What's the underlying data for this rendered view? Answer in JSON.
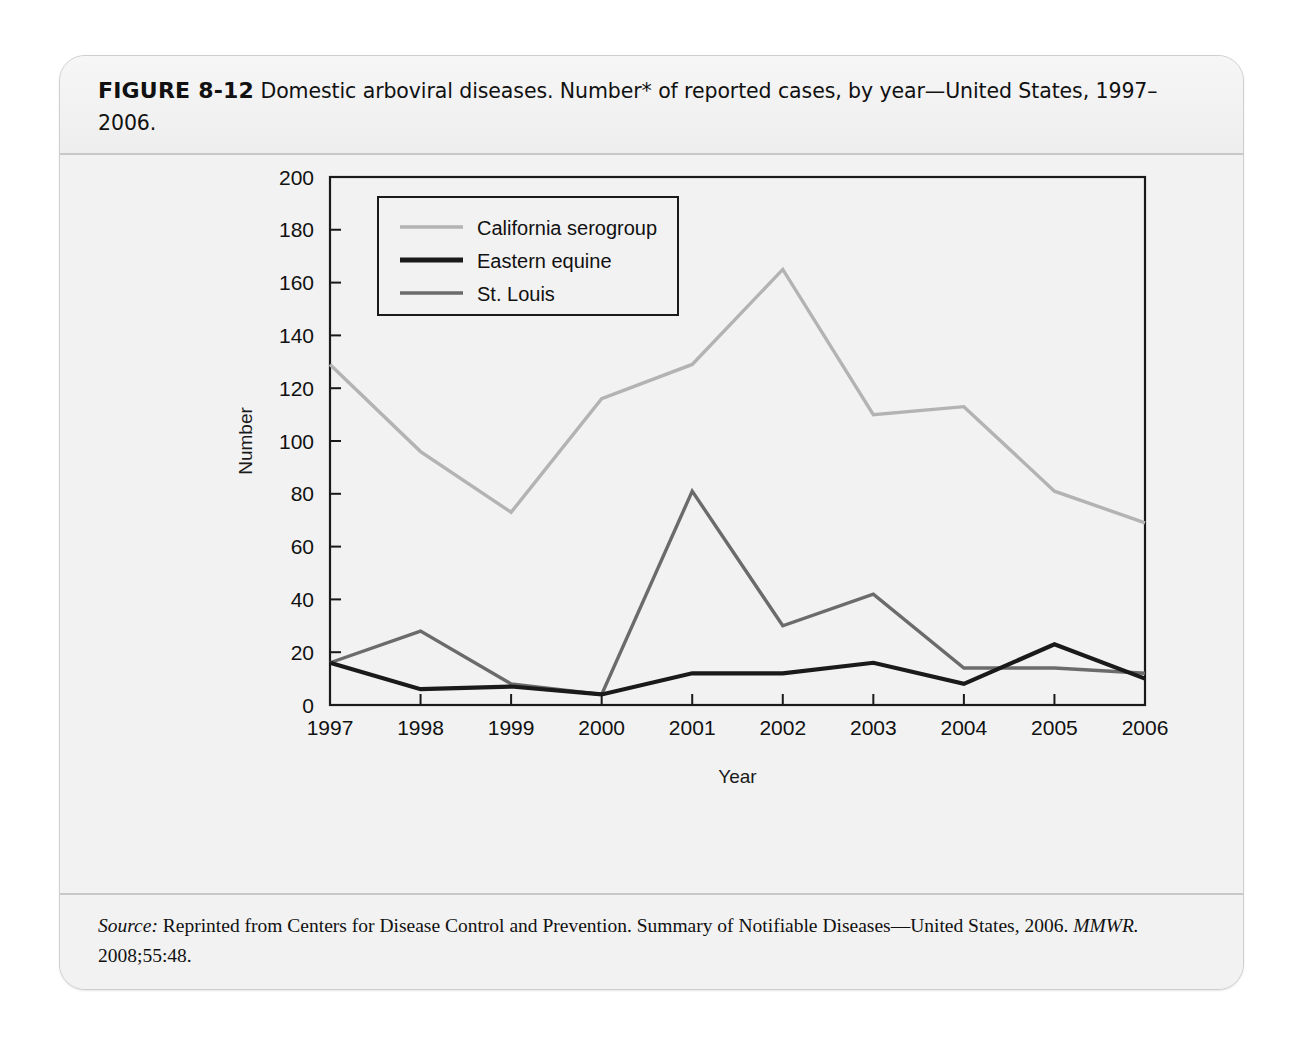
{
  "figure": {
    "label": "FIGURE 8-12",
    "caption": "Domestic arboviral diseases. Number* of reported cases, by year—United States, 1997–2006."
  },
  "footnote": {
    "line1": "*Data from the Division of Vector-Borne Infectious Diseases, National Center for Zoonotic, Vector-",
    "line2": "Borne, and Enteric Diseases (ArboNET Surveillance). Only reported cases of neuroinvasive",
    "line3": "disease are shown."
  },
  "source": {
    "prefix": "Source:",
    "body": "Reprinted from Centers for Disease Control and Prevention. Summary of Notifiable Diseases—United States, 2006.",
    "journal": "MMWR.",
    "citation": "2008;55:48."
  },
  "colors": {
    "california_serogroup": "#b3b3b3",
    "eastern_equine": "#1a1a1a",
    "st_louis": "#6b6b6b",
    "axis": "#1a1a1a",
    "card_background": "#f2f2f2",
    "plot_background": "#f2f2f2"
  },
  "chart_data": {
    "type": "line",
    "title": "",
    "xlabel": "Year",
    "ylabel": "Number",
    "categories": [
      "1997",
      "1998",
      "1999",
      "2000",
      "2001",
      "2002",
      "2003",
      "2004",
      "2005",
      "2006"
    ],
    "x": [
      1997,
      1998,
      1999,
      2000,
      2001,
      2002,
      2003,
      2004,
      2005,
      2006
    ],
    "ylim": [
      0,
      200
    ],
    "yticks": [
      0,
      20,
      40,
      60,
      80,
      100,
      120,
      140,
      160,
      180,
      200
    ],
    "grid": false,
    "legend_position": "top-left inside",
    "series": [
      {
        "name": "California serogroup",
        "color": "#b3b3b3",
        "values": [
          129,
          96,
          73,
          116,
          129,
          165,
          110,
          113,
          81,
          69
        ]
      },
      {
        "name": "Eastern equine",
        "color": "#1a1a1a",
        "values": [
          16,
          6,
          7,
          4,
          12,
          12,
          16,
          8,
          23,
          10
        ]
      },
      {
        "name": "St. Louis",
        "color": "#6b6b6b",
        "values": [
          16,
          28,
          8,
          4,
          81,
          30,
          42,
          14,
          14,
          12
        ]
      }
    ]
  }
}
